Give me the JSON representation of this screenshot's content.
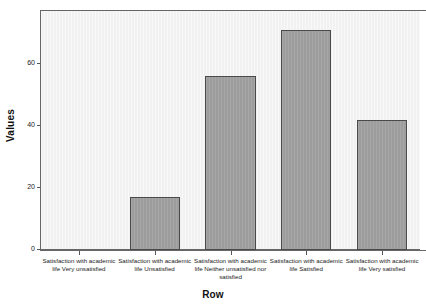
{
  "chart_data": {
    "type": "bar",
    "title": "",
    "subtitle": "",
    "xlabel": "Row",
    "ylabel": "Values",
    "categories": [
      "Satisfaction with academic life Very unsatisfied",
      "Satisfaction with academic life Unsatisfied",
      "Satisfaction with academic life Neither unsatisfied nor satisfied",
      "Satisfaction with academic life Satisfied",
      "Satisfaction with academic life Very satisfied"
    ],
    "values": [
      0,
      17,
      56,
      71,
      42
    ],
    "ylim": [
      0,
      77
    ],
    "yticks": [
      0,
      20,
      40,
      60
    ],
    "ytick_labels": [
      "0",
      "20",
      "40",
      "60"
    ],
    "grid": false,
    "legend": false,
    "legend_position": "none",
    "bar_color": "#9d9d9d",
    "bar_border_color": "#4a4a4a",
    "plot_background": "#f1f1f1",
    "axis_color": "#666666",
    "text_color": "#111111"
  },
  "axes": {
    "y_title": "Values",
    "x_title": "Row"
  }
}
